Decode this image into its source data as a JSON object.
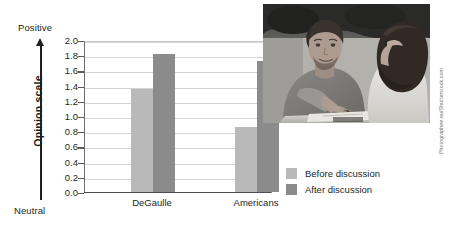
{
  "chart_data": {
    "type": "bar",
    "title": "",
    "categories": [
      "DeGaulle",
      "Americans"
    ],
    "series": [
      {
        "name": "Before discussion",
        "color": "#b9b9b9",
        "values": [
          1.35,
          0.85
        ]
      },
      {
        "name": "After discussion",
        "color": "#8b8b8b",
        "values": [
          1.82,
          1.72
        ]
      }
    ],
    "xlabel": "",
    "ylabel": "Opinion scale",
    "ylim": [
      0.0,
      2.0
    ],
    "ytick_step": 0.2,
    "yticks": [
      "2.0",
      "1.8",
      "1.6",
      "1.4",
      "1.2",
      "1.0",
      "0.8",
      "0.6",
      "0.4",
      "0.2",
      "0.0"
    ],
    "axis_endpoints": {
      "high": "Positive",
      "low": "Neutral"
    },
    "grid": true,
    "legend_position": "right"
  },
  "axis": {
    "positive_label": "Positive",
    "neutral_label": "Neutral",
    "y_title": "Opinion scale"
  },
  "legend": {
    "items": [
      {
        "label": "Before discussion",
        "color": "#b9b9b9"
      },
      {
        "label": "After discussion",
        "color": "#8b8b8b"
      }
    ]
  },
  "photo": {
    "alt": "Two students seated at a table in discussion"
  },
  "credit": {
    "text": "Photographee.eu/Shutterstock.com"
  },
  "colors": {
    "before_bar": "#b9b9b9",
    "after_bar": "#8b8b8b",
    "text": "#231f20",
    "gridline": "#d4d5d7"
  }
}
